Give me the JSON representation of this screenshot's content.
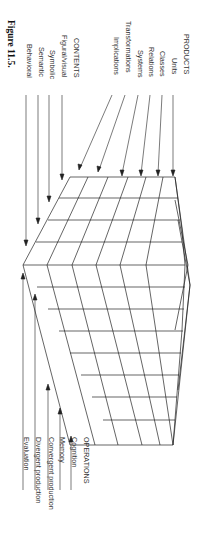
{
  "figure": {
    "caption": "Figure 11.5.",
    "products": {
      "heading": "PRODUCTS",
      "items": [
        "Units",
        "Classes",
        "Relations",
        "Systems",
        "Transformations",
        "Implications"
      ]
    },
    "contents": {
      "heading": "CONTENTS",
      "items": [
        "Figural/visual",
        "Symbolic",
        "Semantic",
        "Behavioral"
      ]
    },
    "operations": {
      "heading": "OPERATIONS",
      "items": [
        "Cognition",
        "Memory",
        "Convergent production",
        "Divergent production",
        "Evaluation"
      ]
    },
    "colors": {
      "line": "#222222",
      "text": "#333333"
    }
  }
}
